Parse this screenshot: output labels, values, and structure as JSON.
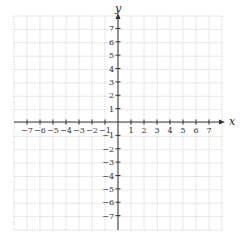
{
  "diagram": {
    "type": "coordinate-plane",
    "x_axis": {
      "label": "x",
      "min": -7,
      "max": 7,
      "tick_labels": [
        "−7",
        "−6",
        "−5",
        "−4",
        "−3",
        "−2",
        "−1",
        "1",
        "2",
        "3",
        "4",
        "5",
        "6",
        "7"
      ]
    },
    "y_axis": {
      "label": "y",
      "min": -7,
      "max": 7,
      "tick_labels": [
        "7",
        "6",
        "5",
        "4",
        "3",
        "2",
        "1",
        "−1",
        "−2",
        "−3",
        "−4",
        "−5",
        "−6",
        "−7"
      ]
    },
    "grid": {
      "cells_x": 16,
      "cells_y": 16,
      "style": "dotted"
    },
    "colors": {
      "grid": "#cfcfcf",
      "axis": "#333333"
    }
  }
}
